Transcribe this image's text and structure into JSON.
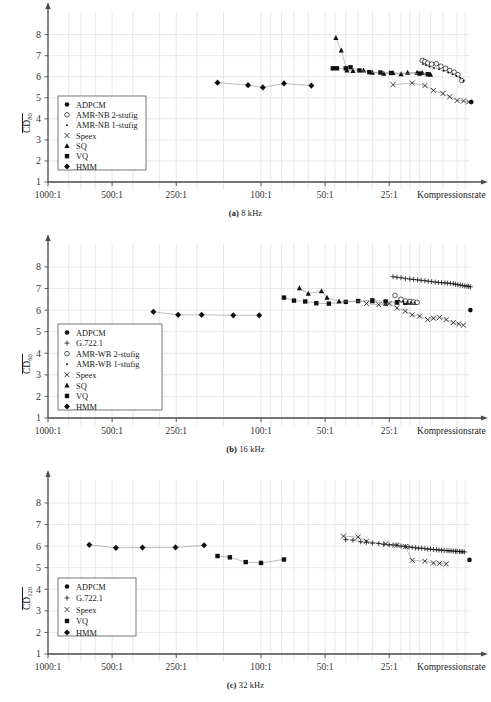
{
  "figure": {
    "kind": "three-panel-scatter-figure",
    "panels": [
      "a",
      "b",
      "c"
    ]
  },
  "axis_common": {
    "ylim": [
      1,
      8.6
    ],
    "yticks": [
      1,
      2,
      3,
      4,
      5,
      6,
      7,
      8
    ],
    "xlabel": "Kompressionsrate",
    "xticklabels": [
      "1000:1",
      "500:1",
      "250:1",
      "100:1",
      "50:1",
      "25:1"
    ],
    "xtickvalues": [
      1000,
      500,
      250,
      100,
      50,
      25
    ],
    "grid": "light-gray vertical and horizontal",
    "axis_color": "#4d4d4d",
    "grid_color": "#d9d9d9",
    "marker_color": "#111111"
  },
  "panels": {
    "a": {
      "caption_prefix": "(a)",
      "caption_text": "8 kHz",
      "ylabel_main": "CD",
      "ylabel_sub": "80",
      "legend": [
        {
          "marker": "filled-circle",
          "label": "ADPCM"
        },
        {
          "marker": "open-circle",
          "label": "AMR-NB 2-stufig"
        },
        {
          "marker": "small-dot",
          "label": "AMR-NB 1-stufig"
        },
        {
          "marker": "cross",
          "label": "Speex"
        },
        {
          "marker": "filled-triangle",
          "label": "SQ"
        },
        {
          "marker": "filled-square",
          "label": "VQ"
        },
        {
          "marker": "filled-diamond",
          "label": "HMM"
        }
      ],
      "chart_data": {
        "type": "scatter",
        "title": "(a) 8 kHz",
        "xlabel": "Kompressionsrate",
        "ylabel": "CD_80",
        "xlim": [
          1000,
          10
        ],
        "ylim": [
          1,
          8.6
        ],
        "xscale": "log-reversed",
        "yticks": [
          1,
          2,
          3,
          4,
          5,
          6,
          7,
          8
        ],
        "grid": true,
        "legend_position": "inside-lower-left",
        "series": [
          {
            "name": "HMM",
            "marker": "filled-diamond",
            "x": [
              160,
              115,
              98,
              78,
              58
            ],
            "y": [
              5.72,
              5.6,
              5.49,
              5.68,
              5.58
            ]
          },
          {
            "name": "SQ",
            "marker": "filled-triangle",
            "x": [
              44.5,
              42.0,
              39.5,
              37.0,
              33.0,
              30.0,
              26.5,
              24.0,
              22.0,
              20.5,
              18.5,
              17.5,
              16.0
            ],
            "y": [
              7.85,
              7.25,
              6.3,
              6.28,
              6.3,
              6.2,
              6.15,
              6.18,
              6.12,
              6.2,
              6.2,
              6.18,
              6.1
            ]
          },
          {
            "name": "VQ",
            "marker": "filled-square",
            "x": [
              46.0,
              44.0,
              40.0,
              38.0,
              34.5,
              31.0,
              27.5,
              24.5,
              18.0,
              16.5
            ],
            "y": [
              6.4,
              6.4,
              6.4,
              6.45,
              6.3,
              6.22,
              6.2,
              6.18,
              6.15,
              6.12
            ]
          },
          {
            "name": "Speex",
            "marker": "cross",
            "x": [
              24.0,
              19.5,
              17.0,
              15.5,
              14.0,
              13.0,
              12.0,
              11.2,
              10.6
            ],
            "y": [
              5.62,
              5.7,
              5.58,
              5.35,
              5.2,
              5.05,
              4.87,
              4.85,
              4.8
            ]
          },
          {
            "name": "AMR-NB 2-stufig",
            "marker": "open-circle",
            "x": [
              17.5,
              17.0,
              16.5,
              15.8,
              15.0,
              14.3,
              13.6,
              13.0,
              12.4,
              11.9,
              11.4
            ],
            "y": [
              6.78,
              6.72,
              6.65,
              6.6,
              6.62,
              6.5,
              6.4,
              6.3,
              6.22,
              6.1,
              5.82
            ]
          },
          {
            "name": "AMR-NB 1-stufig",
            "marker": "small-dot",
            "x": [
              17.4,
              16.8,
              16.2,
              15.4,
              14.6,
              13.9,
              13.2,
              12.6,
              12.1,
              11.6,
              11.2
            ],
            "y": [
              6.6,
              6.55,
              6.48,
              6.42,
              6.36,
              6.28,
              6.2,
              6.12,
              6.05,
              5.95,
              5.8
            ]
          },
          {
            "name": "ADPCM",
            "marker": "filled-circle",
            "x": [
              10.3
            ],
            "y": [
              4.8
            ]
          }
        ]
      }
    },
    "b": {
      "caption_prefix": "(b)",
      "caption_text": "16 kHz",
      "ylabel_main": "CD",
      "ylabel_sub": "60",
      "legend": [
        {
          "marker": "filled-circle",
          "label": "ADPCM"
        },
        {
          "marker": "plus",
          "label": "G.722.1"
        },
        {
          "marker": "open-circle",
          "label": "AMR-WB 2-stufig"
        },
        {
          "marker": "small-dot",
          "label": "AMR-WB 1-stufig"
        },
        {
          "marker": "cross",
          "label": "Speex"
        },
        {
          "marker": "filled-triangle",
          "label": "SQ"
        },
        {
          "marker": "filled-square",
          "label": "VQ"
        },
        {
          "marker": "filled-diamond",
          "label": "HMM"
        }
      ],
      "chart_data": {
        "type": "scatter",
        "title": "(b) 16 kHz",
        "xlabel": "Kompressionsrate",
        "ylabel": "CD_60",
        "xlim": [
          1000,
          10
        ],
        "ylim": [
          1,
          8.6
        ],
        "xscale": "log-reversed",
        "yticks": [
          1,
          2,
          3,
          4,
          5,
          6,
          7,
          8
        ],
        "grid": true,
        "legend_position": "inside-lower-left",
        "series": [
          {
            "name": "HMM",
            "marker": "filled-diamond",
            "x": [
              320,
              245,
              190,
              135,
              102
            ],
            "y": [
              5.92,
              5.78,
              5.78,
              5.76,
              5.76
            ]
          },
          {
            "name": "VQ",
            "marker": "filled-square",
            "x": [
              78,
              70,
              62,
              55,
              48,
              40,
              35,
              30,
              26,
              23,
              21
            ],
            "y": [
              6.58,
              6.44,
              6.4,
              6.32,
              6.3,
              6.38,
              6.42,
              6.45,
              6.4,
              6.36,
              6.34
            ]
          },
          {
            "name": "SQ",
            "marker": "filled-triangle",
            "x": [
              66,
              60,
              52,
              49,
              43,
              30,
              26,
              23,
              21,
              20,
              19
            ],
            "y": [
              7.02,
              6.76,
              6.88,
              6.58,
              6.4,
              6.42,
              6.3,
              6.36,
              6.36,
              6.35,
              6.34
            ]
          },
          {
            "name": "Speex",
            "marker": "cross",
            "x": [
              32,
              28,
              25,
              23,
              21,
              19.5,
              18,
              16.5,
              15.5,
              14.5,
              13.5,
              12.5,
              11.8,
              11.2
            ],
            "y": [
              6.3,
              6.25,
              6.3,
              6.1,
              5.95,
              5.78,
              5.72,
              5.56,
              5.62,
              5.66,
              5.56,
              5.42,
              5.36,
              5.3
            ]
          },
          {
            "name": "G.722.1",
            "marker": "plus",
            "x": [
              24.0,
              23.0,
              22.0,
              21.0,
              20.0,
              19.2,
              18.4,
              17.7,
              17.0,
              16.4,
              15.8,
              15.2,
              14.7,
              14.2,
              13.7,
              13.3,
              12.9,
              12.5,
              12.2,
              11.9,
              11.6,
              11.3,
              11.05,
              10.8,
              10.6,
              10.4
            ],
            "y": [
              7.55,
              7.52,
              7.5,
              7.46,
              7.44,
              7.42,
              7.4,
              7.38,
              7.36,
              7.34,
              7.32,
              7.3,
              7.28,
              7.27,
              7.26,
              7.25,
              7.24,
              7.22,
              7.2,
              7.18,
              7.16,
              7.14,
              7.12,
              7.11,
              7.1,
              7.08
            ]
          },
          {
            "name": "AMR-WB 2-stufig",
            "marker": "open-circle",
            "x": [
              23.5,
              22.0,
              21.0,
              20.0,
              19.2,
              18.5
            ],
            "y": [
              6.68,
              6.5,
              6.42,
              6.4,
              6.38,
              6.36
            ]
          },
          {
            "name": "AMR-WB 1-stufig",
            "marker": "small-dot",
            "x": [
              22.5,
              21.5,
              20.5,
              19.8,
              19.0
            ],
            "y": [
              6.44,
              6.4,
              6.38,
              6.36,
              6.35
            ]
          },
          {
            "name": "ADPCM",
            "marker": "filled-circle",
            "x": [
              10.4
            ],
            "y": [
              6.0
            ]
          }
        ]
      }
    },
    "c": {
      "caption_prefix": "(c)",
      "caption_text": "32 kHz",
      "ylabel_main": "CD",
      "ylabel_sub": "120",
      "legend": [
        {
          "marker": "filled-circle",
          "label": "ADPCM"
        },
        {
          "marker": "plus",
          "label": "G.722.1"
        },
        {
          "marker": "cross",
          "label": "Speex"
        },
        {
          "marker": "filled-square",
          "label": "VQ"
        },
        {
          "marker": "filled-diamond",
          "label": "HMM"
        }
      ],
      "chart_data": {
        "type": "scatter",
        "title": "(c) 32 kHz",
        "xlabel": "Kompressionsrate",
        "ylabel": "CD_120",
        "xlim": [
          1000,
          10
        ],
        "ylim": [
          1,
          8.6
        ],
        "xscale": "log-reversed",
        "yticks": [
          1,
          2,
          3,
          4,
          5,
          6,
          7,
          8
        ],
        "grid": true,
        "legend_position": "inside-lower-left",
        "series": [
          {
            "name": "HMM",
            "marker": "filled-diamond",
            "x": [
              640,
              480,
              360,
              252,
              185
            ],
            "y": [
              6.06,
              5.92,
              5.93,
              5.94,
              6.04
            ]
          },
          {
            "name": "VQ",
            "marker": "filled-square",
            "x": [
              160,
              140,
              118,
              100,
              78
            ],
            "y": [
              5.54,
              5.48,
              5.26,
              5.22,
              5.38
            ]
          },
          {
            "name": "Speex",
            "marker": "cross",
            "x": [
              41,
              35,
              32,
              26,
              23,
              21,
              19.5,
              17.0,
              15.5,
              14.5,
              13.5
            ],
            "y": [
              6.46,
              6.42,
              6.22,
              6.1,
              6.04,
              5.98,
              5.34,
              5.3,
              5.22,
              5.2,
              5.18
            ]
          },
          {
            "name": "G.722.1",
            "marker": "plus",
            "x": [
              40,
              37,
              34,
              32,
              30,
              28,
              26.5,
              25,
              24,
              23,
              22,
              21,
              20.2,
              19.5,
              18.8,
              18.2,
              17.6,
              17.0,
              16.5,
              16.0,
              15.5,
              15.0,
              14.6,
              14.2,
              13.8,
              13.4,
              13.1,
              12.8,
              12.5,
              12.2,
              12.0,
              11.7,
              11.5,
              11.3,
              11.1
            ],
            "y": [
              6.3,
              6.28,
              6.2,
              6.18,
              6.14,
              6.12,
              6.08,
              6.06,
              6.05,
              6.04,
              6.0,
              5.98,
              5.96,
              5.94,
              5.92,
              5.9,
              5.9,
              5.88,
              5.86,
              5.86,
              5.84,
              5.83,
              5.82,
              5.81,
              5.8,
              5.79,
              5.78,
              5.78,
              5.77,
              5.76,
              5.76,
              5.75,
              5.74,
              5.74,
              5.73
            ]
          },
          {
            "name": "ADPCM",
            "marker": "filled-circle",
            "x": [
              10.5
            ],
            "y": [
              5.36
            ]
          }
        ]
      }
    }
  }
}
